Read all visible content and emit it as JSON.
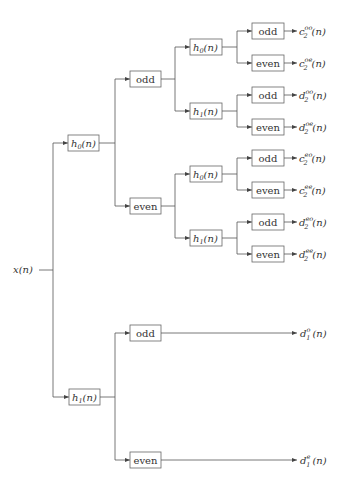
{
  "diagram": {
    "input": "x(n)",
    "level1": [
      {
        "filter": "h",
        "idx": "0",
        "arg": "(n)"
      },
      {
        "filter": "h",
        "idx": "1",
        "arg": "(n)"
      }
    ],
    "level2_upper": [
      "odd",
      "even"
    ],
    "level3": [
      {
        "filter": "h",
        "idx": "0",
        "arg": "(n)"
      },
      {
        "filter": "h",
        "idx": "1",
        "arg": "(n)"
      },
      {
        "filter": "h",
        "idx": "0",
        "arg": "(n)"
      },
      {
        "filter": "h",
        "idx": "1",
        "arg": "(n)"
      }
    ],
    "leaves": [
      "odd",
      "even",
      "odd",
      "even",
      "odd",
      "even",
      "odd",
      "even"
    ],
    "outputs": [
      {
        "base": "c",
        "sub": "2",
        "sup": "oo",
        "arg": "(n)"
      },
      {
        "base": "c",
        "sub": "2",
        "sup": "oe",
        "arg": "(n)"
      },
      {
        "base": "d",
        "sub": "2",
        "sup": "oo",
        "arg": "(n)"
      },
      {
        "base": "d",
        "sub": "2",
        "sup": "oe",
        "arg": "(n)"
      },
      {
        "base": "c",
        "sub": "2",
        "sup": "eo",
        "arg": "(n)"
      },
      {
        "base": "c",
        "sub": "2",
        "sup": "ee",
        "arg": "(n)"
      },
      {
        "base": "d",
        "sub": "2",
        "sup": "eo",
        "arg": "(n)"
      },
      {
        "base": "d",
        "sub": "2",
        "sup": "ee",
        "arg": "(n)"
      }
    ],
    "level2_lower": [
      "odd",
      "even"
    ],
    "lower_outputs": [
      {
        "base": "d",
        "sub": "1",
        "sup": "o",
        "arg": "(n)"
      },
      {
        "base": "d",
        "sub": "1",
        "sup": "e",
        "arg": "(n)"
      }
    ]
  }
}
